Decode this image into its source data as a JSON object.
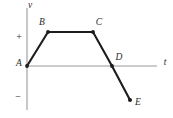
{
  "chart_data": {
    "type": "line",
    "title": "",
    "xlabel": "t",
    "ylabel": "v",
    "grid": false,
    "legend": false,
    "axis_labels": {
      "vertical": "v",
      "horizontal": "t"
    },
    "tick_labels": {
      "positive": "+",
      "negative": "−"
    },
    "point_labels": [
      "A",
      "B",
      "C",
      "D",
      "E"
    ],
    "x": [
      0,
      1,
      3,
      4,
      4.8
    ],
    "values": [
      0,
      1,
      1,
      0,
      -1
    ],
    "points": [
      {
        "label": "A",
        "x": 0,
        "v": 0,
        "px": 27,
        "py": 66
      },
      {
        "label": "B",
        "x": 1,
        "v": 1,
        "px": 48,
        "py": 32
      },
      {
        "label": "C",
        "x": 3,
        "v": 1,
        "px": 93,
        "py": 32
      },
      {
        "label": "D",
        "x": 4,
        "v": 0,
        "px": 112,
        "py": 66
      },
      {
        "label": "E",
        "x": 4.8,
        "v": -1,
        "px": 130,
        "py": 100
      }
    ],
    "xlim": [
      0,
      5.5
    ],
    "ylim": [
      -1.7,
      1.7
    ],
    "colors": {
      "curve": "#1c1c1c",
      "axis": "#9a9a9a",
      "background": "#ffffff"
    }
  },
  "labels": {
    "A": "A",
    "B": "B",
    "C": "C",
    "D": "D",
    "E": "E",
    "v_axis": "v",
    "t_axis": "t",
    "plus": "+",
    "minus": "−"
  }
}
